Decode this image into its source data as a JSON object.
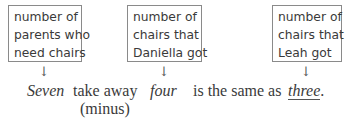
{
  "diagram": {
    "boxes": [
      {
        "lines": [
          "number of",
          "parents who",
          "need chairs"
        ]
      },
      {
        "lines": [
          "number of",
          "chairs that",
          "Daniella got"
        ]
      },
      {
        "lines": [
          "number of",
          "chairs that",
          "Leah got"
        ]
      }
    ],
    "arrow_glyph": "↓",
    "sentence": {
      "seven": "Seven",
      "take_away": "take away",
      "minus": "(minus)",
      "four": "four",
      "is_same_as": "is the same as",
      "three": "three",
      "period": "."
    }
  }
}
